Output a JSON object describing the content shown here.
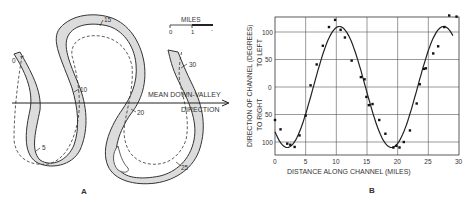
{
  "panel_a": {
    "label": "A",
    "scale_title": "MILES",
    "scale_ticks": [
      "0",
      "1",
      "-"
    ],
    "arrow_label_line1": "MEAN DOWN-VALLEY",
    "arrow_label_line2": "DIRECTION",
    "mile_markers": [
      {
        "label": "0",
        "x": 14,
        "y": 61
      },
      {
        "label": "5",
        "x": 41,
        "y": 149
      },
      {
        "label": "10",
        "x": 80,
        "y": 91
      },
      {
        "label": "15",
        "x": 104,
        "y": 20
      },
      {
        "label": "20",
        "x": 139,
        "y": 115
      },
      {
        "label": "25",
        "x": 182,
        "y": 169
      },
      {
        "label": "30",
        "x": 189,
        "y": 66
      }
    ]
  },
  "panel_b": {
    "label": "B"
  },
  "chart_data": {
    "type": "scatter",
    "title": "",
    "xlabel": "DISTANCE ALONG CHANNEL (MILES)",
    "ylabel": "DIRECTION OF CHANNEL (DEGREES)",
    "ylabel_upper": "TO LEFT",
    "ylabel_lower": "TO RIGHT",
    "xlim": [
      0,
      30
    ],
    "ylim": [
      -125,
      125
    ],
    "x_ticks": [
      "0",
      "5",
      "10",
      "15",
      "20",
      "25",
      "30"
    ],
    "y_ticks": [
      "100",
      "50",
      "0",
      "50",
      "100"
    ],
    "y_tick_values": [
      100,
      50,
      0,
      -50,
      -100
    ],
    "grid": true,
    "series": [
      {
        "name": "measured direction",
        "kind": "points",
        "x": [
          0.0,
          0.9,
          2.0,
          2.5,
          3.2,
          4.0,
          5.0,
          5.8,
          6.8,
          7.8,
          8.8,
          9.8,
          10.7,
          11.4,
          12.5,
          14.0,
          14.6,
          14.9,
          15.3,
          15.9,
          17.0,
          18.0,
          19.3,
          19.8,
          20.3,
          21.0,
          22.0,
          23.1,
          23.6,
          24.3,
          24.6,
          25.8,
          26.6,
          27.6,
          28.4,
          29.6
        ],
        "y": [
          -60,
          -77,
          -103,
          -105,
          -109,
          -88,
          -52,
          3,
          41,
          75,
          109,
          122,
          104,
          90,
          48,
          18,
          14,
          -18,
          -33,
          -31,
          -60,
          -85,
          -110,
          -107,
          -110,
          -100,
          -79,
          -30,
          5,
          33,
          34,
          61,
          74,
          109,
          130,
          128
        ]
      },
      {
        "name": "sine-generated curve",
        "kind": "line",
        "amplitude": 110,
        "wavelength": 17,
        "phase_zero_at": 6.25
      }
    ]
  }
}
